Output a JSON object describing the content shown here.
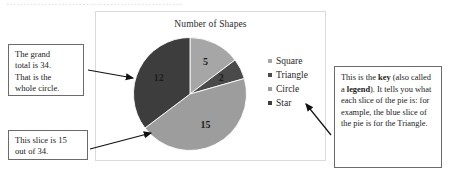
{
  "page": {
    "top_cutoff_text": "……………………………………………"
  },
  "chart": {
    "title": "Number of Shapes",
    "legend": {
      "items": [
        {
          "label": "Square",
          "color": "#a6a6a6"
        },
        {
          "label": "Triangle",
          "color": "#4a4a4a"
        },
        {
          "label": "Circle",
          "color": "#9d9d9d"
        },
        {
          "label": "Star",
          "color": "#3d3d3d"
        }
      ]
    }
  },
  "chart_data": {
    "type": "pie",
    "title": "Number of Shapes",
    "categories": [
      "Square",
      "Triangle",
      "Circle",
      "Star"
    ],
    "values": [
      5,
      2,
      15,
      12
    ],
    "total": 34,
    "data_labels": [
      "5",
      "2",
      "15",
      "12"
    ],
    "colors": [
      "#a6a6a6",
      "#4a4a4a",
      "#9d9d9d",
      "#3d3d3d"
    ],
    "start_angle_deg": 0,
    "direction": "clockwise",
    "legend_position": "right",
    "grid": false,
    "xlabel": "",
    "ylabel": ""
  },
  "callouts": {
    "total": {
      "name": "grand-total-callout",
      "lines": [
        "The grand",
        "total is 34.",
        "That is the",
        " whole circle."
      ]
    },
    "slice": {
      "name": "slice-value-callout",
      "lines": [
        "This slice is 15",
        "out of 34."
      ]
    },
    "key": {
      "name": "key-explanation-callout",
      "segments": [
        {
          "text": "This is the ",
          "bold": false
        },
        {
          "text": "key",
          "bold": true
        },
        {
          "text": " (also called a ",
          "bold": false
        },
        {
          "text": "legend",
          "bold": true
        },
        {
          "text": "). It tells you what each slice of the pie is: for example, the blue slice of the pie is for the Triangle.",
          "bold": false
        }
      ],
      "part1": "This is the ",
      "bold1": "key",
      "part2": " (also called a ",
      "bold2": "legend",
      "part3": "). It tells you what each slice of the pie is: for example, the blue slice of the pie is for the Triangle."
    }
  }
}
